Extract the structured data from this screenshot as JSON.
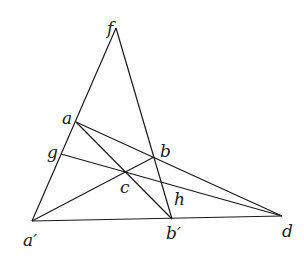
{
  "diagram": {
    "type": "projective-geometry-construction",
    "stroke_color": "#1a1a1a",
    "background": "#ffffff",
    "points": {
      "f": {
        "label": "f",
        "x": 116,
        "y": 28,
        "lx": 107,
        "ly": 34
      },
      "a": {
        "label": "a",
        "x": 76,
        "y": 122,
        "lx": 62,
        "ly": 124
      },
      "g": {
        "label": "g",
        "x": 61,
        "y": 154,
        "lx": 47,
        "ly": 158
      },
      "b": {
        "label": "b",
        "x": 154,
        "y": 157,
        "lx": 160,
        "ly": 157
      },
      "c": {
        "label": "c",
        "x": 126,
        "y": 173,
        "lx": 120,
        "ly": 193
      },
      "h": {
        "label": "h",
        "x": 162,
        "y": 183,
        "lx": 174,
        "ly": 205
      },
      "a_prime": {
        "label": "a′",
        "x": 32,
        "y": 221,
        "lx": 23,
        "ly": 246
      },
      "b_prime": {
        "label": "b′",
        "x": 172,
        "y": 219,
        "lx": 166,
        "ly": 239
      },
      "d": {
        "label": "d",
        "x": 282,
        "y": 216,
        "lx": 282,
        "ly": 237
      }
    },
    "segments": [
      {
        "name": "line-f-aprime",
        "from": "f",
        "to": "a_prime"
      },
      {
        "name": "line-f-bprime",
        "from": "f",
        "to": "b_prime"
      },
      {
        "name": "line-aprime-d",
        "from": "a_prime",
        "to": "d"
      },
      {
        "name": "line-a-d",
        "from": "a",
        "to": "d"
      },
      {
        "name": "line-a-bprime",
        "from": "a",
        "to": "b_prime"
      },
      {
        "name": "line-aprime-b",
        "from": "a_prime",
        "to": "b"
      },
      {
        "name": "line-g-d",
        "from": "g",
        "to": "d"
      }
    ]
  }
}
